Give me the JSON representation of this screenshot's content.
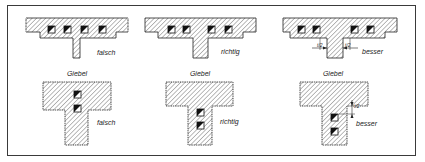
{
  "figure": {
    "rows": [
      {
        "name": "wall-junction-plan",
        "panels": [
          {
            "label": "falsch"
          },
          {
            "label": "richtig"
          },
          {
            "label": "besser",
            "dimension_left": "t/2",
            "dimension_right": "t/2"
          }
        ]
      },
      {
        "name": "gable-junction-plan",
        "panels": [
          {
            "label": "falsch",
            "heading": "Giebel"
          },
          {
            "label": "richtig",
            "heading": "Giebel"
          },
          {
            "label": "besser",
            "heading": "Giebel",
            "dimension": "t/2"
          }
        ]
      }
    ],
    "colors": {
      "line": "#222222",
      "hatch": "#555555",
      "frame": "#3a3a3a",
      "background": "#ffffff"
    }
  }
}
